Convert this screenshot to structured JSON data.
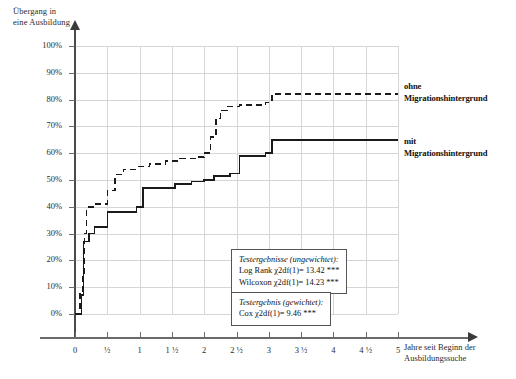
{
  "axes": {
    "y_title": "Übergang in\neine Ausbildung",
    "x_title": "Jahre seit Beginn der\nAusbildungssuche",
    "y_ticks": [
      "0%",
      "10%",
      "20%",
      "30%",
      "40%",
      "50%",
      "60%",
      "70%",
      "80%",
      "90%",
      "100%"
    ],
    "x_ticks": [
      "0",
      "½",
      "1",
      "1 ½",
      "2",
      "2 ½",
      "3",
      "3 ½",
      "4",
      "4 ½",
      "5"
    ]
  },
  "legend": {
    "ohne": "ohne\nMigrationshintergrund",
    "mit": "mit\nMigrationshintergrund"
  },
  "statbox_unweighted": {
    "title": "Testergebnisse (ungewichtet):",
    "line1": "Log Rank χ2df(1)= 13.42 ***",
    "line2": "Wilcoxon χ2df(1)= 14.23 ***"
  },
  "statbox_weighted": {
    "title": "Testergebnis (gewichtet):",
    "line1": "Cox χ2df(1)= 9.46 ***"
  },
  "chart_data": {
    "type": "line",
    "title": "",
    "xlabel": "Jahre seit Beginn der Ausbildungssuche",
    "ylabel": "Übergang in eine Ausbildung",
    "xlim": [
      0,
      5
    ],
    "ylim": [
      0,
      1.0
    ],
    "grid": true,
    "legend_position": "right",
    "style": "step (Kaplan-Meier cumulative incidence)",
    "series": [
      {
        "name": "ohne Migrationshintergrund",
        "linestyle": "dashed",
        "color": "#1a1a1a",
        "points": [
          [
            0.0,
            0.0
          ],
          [
            0.08,
            0.0
          ],
          [
            0.08,
            0.08
          ],
          [
            0.12,
            0.08
          ],
          [
            0.12,
            0.14
          ],
          [
            0.15,
            0.14
          ],
          [
            0.15,
            0.3
          ],
          [
            0.18,
            0.3
          ],
          [
            0.18,
            0.4
          ],
          [
            0.3,
            0.4
          ],
          [
            0.3,
            0.41
          ],
          [
            0.5,
            0.41
          ],
          [
            0.5,
            0.46
          ],
          [
            0.62,
            0.46
          ],
          [
            0.62,
            0.52
          ],
          [
            0.75,
            0.52
          ],
          [
            0.75,
            0.54
          ],
          [
            0.95,
            0.54
          ],
          [
            0.95,
            0.55
          ],
          [
            1.15,
            0.55
          ],
          [
            1.15,
            0.56
          ],
          [
            1.4,
            0.56
          ],
          [
            1.4,
            0.57
          ],
          [
            1.62,
            0.57
          ],
          [
            1.62,
            0.58
          ],
          [
            1.88,
            0.58
          ],
          [
            1.88,
            0.585
          ],
          [
            2.0,
            0.585
          ],
          [
            2.0,
            0.6
          ],
          [
            2.1,
            0.6
          ],
          [
            2.1,
            0.66
          ],
          [
            2.18,
            0.66
          ],
          [
            2.18,
            0.73
          ],
          [
            2.25,
            0.73
          ],
          [
            2.25,
            0.76
          ],
          [
            2.35,
            0.76
          ],
          [
            2.35,
            0.775
          ],
          [
            2.55,
            0.775
          ],
          [
            2.55,
            0.78
          ],
          [
            2.95,
            0.78
          ],
          [
            2.95,
            0.79
          ],
          [
            3.05,
            0.79
          ],
          [
            3.05,
            0.82
          ],
          [
            5.0,
            0.82
          ]
        ]
      },
      {
        "name": "mit Migrationshintergrund",
        "linestyle": "solid",
        "color": "#1a1a1a",
        "points": [
          [
            0.0,
            0.0
          ],
          [
            0.1,
            0.0
          ],
          [
            0.1,
            0.07
          ],
          [
            0.13,
            0.07
          ],
          [
            0.13,
            0.27
          ],
          [
            0.22,
            0.27
          ],
          [
            0.22,
            0.3
          ],
          [
            0.3,
            0.3
          ],
          [
            0.3,
            0.325
          ],
          [
            0.5,
            0.325
          ],
          [
            0.5,
            0.38
          ],
          [
            0.95,
            0.38
          ],
          [
            0.95,
            0.4
          ],
          [
            1.05,
            0.4
          ],
          [
            1.05,
            0.47
          ],
          [
            1.55,
            0.47
          ],
          [
            1.55,
            0.485
          ],
          [
            1.8,
            0.485
          ],
          [
            1.8,
            0.495
          ],
          [
            2.0,
            0.495
          ],
          [
            2.0,
            0.5
          ],
          [
            2.15,
            0.5
          ],
          [
            2.15,
            0.515
          ],
          [
            2.4,
            0.515
          ],
          [
            2.4,
            0.525
          ],
          [
            2.55,
            0.525
          ],
          [
            2.55,
            0.59
          ],
          [
            2.95,
            0.59
          ],
          [
            2.95,
            0.6
          ],
          [
            3.05,
            0.6
          ],
          [
            3.05,
            0.65
          ],
          [
            5.0,
            0.65
          ]
        ]
      }
    ]
  }
}
